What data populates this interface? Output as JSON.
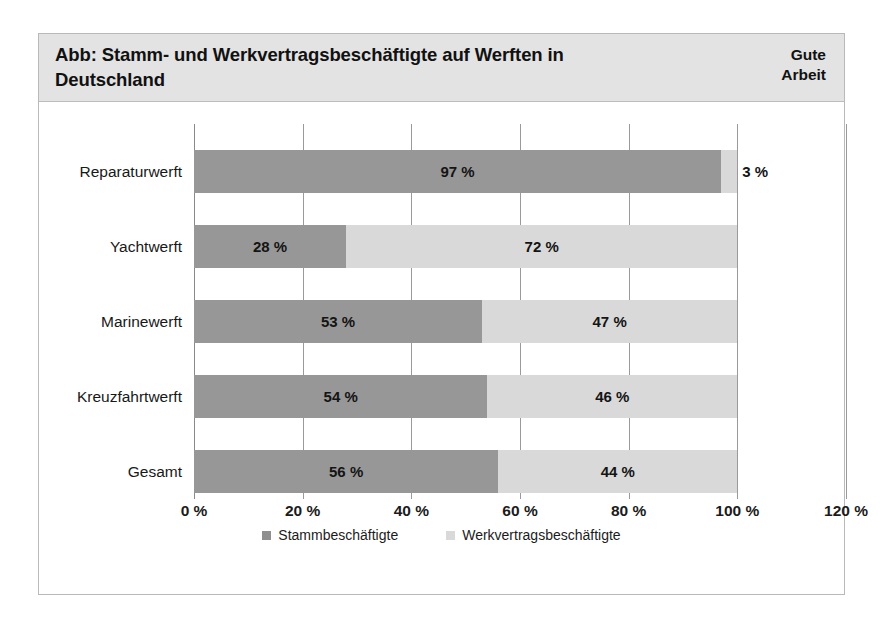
{
  "figure": {
    "title": "Abb: Stamm- und Werkvertragsbeschäftigte auf Werften in Deutschland",
    "logo": "Gute\nArbeit"
  },
  "chart_data": {
    "type": "bar",
    "orientation": "horizontal",
    "stacked": true,
    "stack_mode": "percent",
    "title": "Abb: Stamm- und Werkvertragsbeschäftigte auf Werften in Deutschland",
    "xlabel": "",
    "ylabel": "",
    "xlim": [
      0,
      120
    ],
    "xticks": [
      0,
      20,
      40,
      60,
      80,
      100,
      120
    ],
    "xtick_labels": [
      "0 %",
      "20 %",
      "40 %",
      "60 %",
      "80 %",
      "100 %",
      "120 %"
    ],
    "grid": true,
    "legend_position": "bottom",
    "categories": [
      "Reparaturwerft",
      "Yachtwerft",
      "Marinewerft",
      "Kreuzfahrtwerft",
      "Gesamt"
    ],
    "series": [
      {
        "name": "Stammbeschäftigte",
        "color": "#979797",
        "values": [
          97,
          28,
          53,
          54,
          56
        ],
        "labels": [
          "97 %",
          "28 %",
          "53 %",
          "54 %",
          "56 %"
        ]
      },
      {
        "name": "Werkvertragsbeschäftigte",
        "color": "#d9d9d9",
        "values": [
          3,
          72,
          47,
          46,
          44
        ],
        "labels": [
          "3 %",
          "72 %",
          "47 %",
          "46 %",
          "44 %"
        ]
      }
    ]
  }
}
